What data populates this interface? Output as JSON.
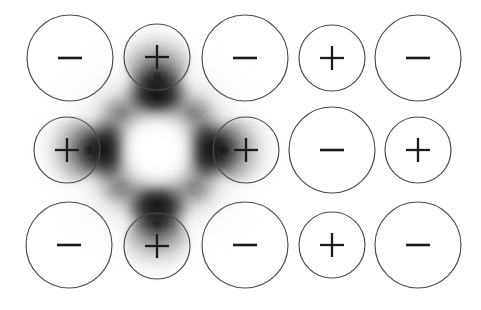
{
  "figure": {
    "width": 481,
    "height": 310,
    "background_color": "#ffffff",
    "outline_color": "#4a4a4a",
    "glyph_color": "#1b1b1b",
    "cloud_color": "#000000"
  },
  "grid": {
    "rows": 3,
    "columns": 5,
    "column_centers_x": [
      70,
      157,
      245,
      332,
      418
    ],
    "row_centers_y": [
      58,
      150,
      245
    ],
    "anion_radius": 43,
    "cation_radius": 33
  },
  "ions": [
    {
      "id": "ion-r0c0",
      "row": 0,
      "col": 0,
      "sign": "minus",
      "label": "−",
      "cx": 70,
      "cy": 58,
      "r": 43,
      "shaded": false
    },
    {
      "id": "ion-r0c1",
      "row": 0,
      "col": 1,
      "sign": "plus",
      "label": "+",
      "cx": 157,
      "cy": 57,
      "r": 33,
      "shaded": true
    },
    {
      "id": "ion-r0c2",
      "row": 0,
      "col": 2,
      "sign": "minus",
      "label": "−",
      "cx": 245,
      "cy": 58,
      "r": 43,
      "shaded": false
    },
    {
      "id": "ion-r0c3",
      "row": 0,
      "col": 3,
      "sign": "plus",
      "label": "+",
      "cx": 332,
      "cy": 58,
      "r": 33,
      "shaded": false
    },
    {
      "id": "ion-r0c4",
      "row": 0,
      "col": 4,
      "sign": "minus",
      "label": "−",
      "cx": 418,
      "cy": 58,
      "r": 43,
      "shaded": false
    },
    {
      "id": "ion-r1c0",
      "row": 1,
      "col": 0,
      "sign": "plus",
      "label": "+",
      "cx": 67,
      "cy": 150,
      "r": 33,
      "shaded": true
    },
    {
      "id": "ion-r1c1",
      "row": 1,
      "col": 1,
      "sign": "none",
      "label": "",
      "cx": 157,
      "cy": 150,
      "r": 0,
      "shaded": false
    },
    {
      "id": "ion-r1c2",
      "row": 1,
      "col": 2,
      "sign": "plus",
      "label": "+",
      "cx": 246,
      "cy": 150,
      "r": 33,
      "shaded": true
    },
    {
      "id": "ion-r1c3",
      "row": 1,
      "col": 3,
      "sign": "minus",
      "label": "−",
      "cx": 332,
      "cy": 150,
      "r": 43,
      "shaded": false
    },
    {
      "id": "ion-r1c4",
      "row": 1,
      "col": 4,
      "sign": "plus",
      "label": "+",
      "cx": 418,
      "cy": 150,
      "r": 33,
      "shaded": false
    },
    {
      "id": "ion-r2c0",
      "row": 2,
      "col": 0,
      "sign": "minus",
      "label": "−",
      "cx": 69,
      "cy": 245,
      "r": 43,
      "shaded": false
    },
    {
      "id": "ion-r2c1",
      "row": 2,
      "col": 1,
      "sign": "plus",
      "label": "+",
      "cx": 157,
      "cy": 246,
      "r": 33,
      "shaded": true
    },
    {
      "id": "ion-r2c2",
      "row": 2,
      "col": 2,
      "sign": "minus",
      "label": "−",
      "cx": 245,
      "cy": 245,
      "r": 43,
      "shaded": false
    },
    {
      "id": "ion-r2c3",
      "row": 2,
      "col": 3,
      "sign": "plus",
      "label": "+",
      "cx": 332,
      "cy": 245,
      "r": 33,
      "shaded": false
    },
    {
      "id": "ion-r2c4",
      "row": 2,
      "col": 4,
      "sign": "minus",
      "label": "−",
      "cx": 418,
      "cy": 245,
      "r": 43,
      "shaded": false
    }
  ],
  "density_cloud": {
    "name": "four-lobed-charge-density",
    "center_x": 157,
    "center_y": 150,
    "hole_radius": 34,
    "lobes": [
      {
        "direction": "up",
        "cx": 157,
        "cy": 98,
        "rx": 40,
        "ry": 34
      },
      {
        "direction": "down",
        "cx": 157,
        "cy": 202,
        "rx": 40,
        "ry": 34
      },
      {
        "direction": "left",
        "cx": 105,
        "cy": 150,
        "rx": 34,
        "ry": 40
      },
      {
        "direction": "right",
        "cx": 209,
        "cy": 150,
        "rx": 34,
        "ry": 40
      }
    ],
    "extent_x": [
      28,
      288
    ],
    "extent_y": [
      20,
      282
    ],
    "max_opacity": 0.92
  }
}
